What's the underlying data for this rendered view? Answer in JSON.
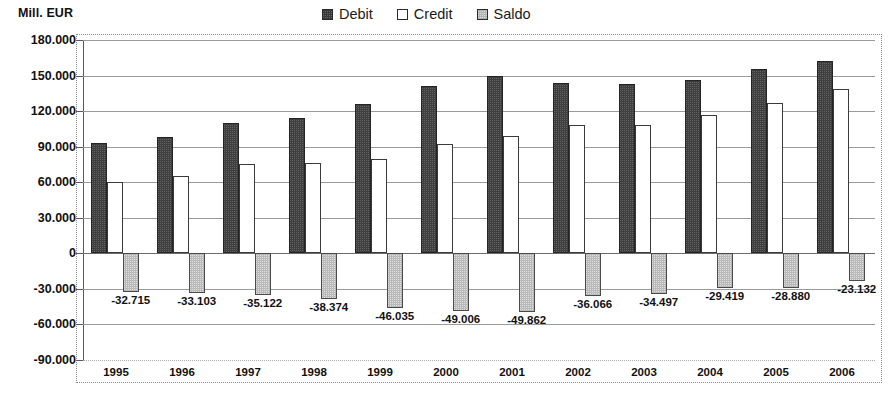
{
  "axis_title": "Mill. EUR",
  "legend": {
    "items": [
      {
        "label": "Debit",
        "swatch": "dark-filled-square-icon"
      },
      {
        "label": "Credit",
        "swatch": "white-outline-square-icon"
      },
      {
        "label": "Saldo",
        "swatch": "gray-filled-square-icon"
      }
    ]
  },
  "colors": {
    "debit": "#3f3f3f",
    "credit": "#ffffff",
    "saldo": "#b9b9b9",
    "gridline": "#9a9a9a",
    "axis": "#5a5a5a",
    "text": "#111111"
  },
  "y_axis": {
    "labels": [
      "180.000",
      "150.000",
      "120.000",
      "90.000",
      "60.000",
      "30.000",
      "0",
      "-30.000",
      "-60.000",
      "-90.000"
    ],
    "values": [
      180000,
      150000,
      120000,
      90000,
      60000,
      30000,
      0,
      -30000,
      -60000,
      -90000
    ],
    "min": -90000,
    "max": 180000,
    "step": 30000,
    "unit": "Mill. EUR"
  },
  "chart_data": {
    "type": "bar",
    "title": "",
    "subtitle": "",
    "xlabel": "",
    "ylabel": "Mill. EUR",
    "ylim": [
      -90000,
      180000
    ],
    "ytick_step": 30000,
    "grid": true,
    "legend_position": "top-right",
    "categories": [
      "1995",
      "1996",
      "1997",
      "1998",
      "1999",
      "2000",
      "2001",
      "2002",
      "2003",
      "2004",
      "2005",
      "2006"
    ],
    "series": [
      {
        "name": "Debit",
        "color": "#3f3f3f",
        "labels_shown": false,
        "values": [
          92715,
          98103,
          110122,
          114374,
          126035,
          141006,
          149862,
          144066,
          142497,
          146419,
          155880,
          162132
        ]
      },
      {
        "name": "Credit",
        "color": "#ffffff",
        "labels_shown": false,
        "values": [
          60000,
          65000,
          75000,
          76000,
          80000,
          92000,
          99000,
          108000,
          108000,
          117000,
          127000,
          139000
        ]
      },
      {
        "name": "Saldo",
        "color": "#b9b9b9",
        "labels_shown": true,
        "values": [
          -32715,
          -33103,
          -35122,
          -38374,
          -46035,
          -49006,
          -49862,
          -36066,
          -34497,
          -29419,
          -28880,
          -23132
        ],
        "value_labels": [
          "-32.715",
          "-33.103",
          "-35.122",
          "-38.374",
          "-46.035",
          "-49.006",
          "-49.862",
          "-36.066",
          "-34.497",
          "-29.419",
          "-28.880",
          "-23.132"
        ]
      }
    ]
  }
}
